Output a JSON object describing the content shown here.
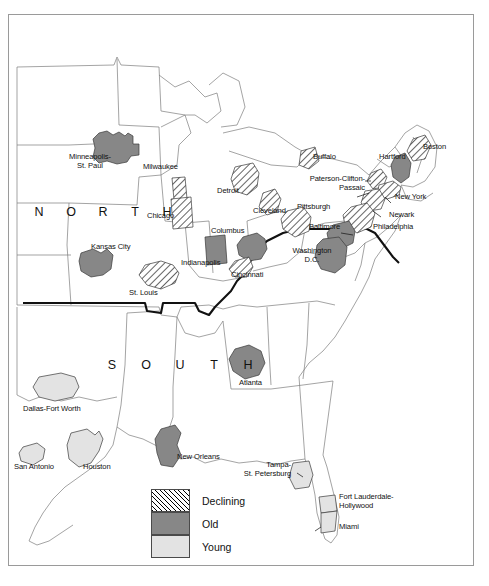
{
  "figure": {
    "regions": [
      {
        "name": "north",
        "letters": [
          "N",
          "O",
          "R",
          "T",
          "H"
        ]
      },
      {
        "name": "south",
        "letters": [
          "S",
          "O",
          "U",
          "T",
          "H"
        ]
      }
    ]
  },
  "legend": {
    "title": "",
    "items": [
      {
        "key": "declining",
        "label": "Declining",
        "pattern": "diagonal-hatch",
        "color": "#ffffff"
      },
      {
        "key": "old",
        "label": "Old",
        "pattern": "solid",
        "color": "#878787"
      },
      {
        "key": "young",
        "label": "Young",
        "pattern": "solid",
        "color": "#e3e3e3"
      }
    ]
  },
  "cities": [
    {
      "id": "minneapolis-st-paul",
      "label": "Minneapolis-\nSt. Paul",
      "category": "old"
    },
    {
      "id": "milwaukee",
      "label": "Milwaukee",
      "category": "declining"
    },
    {
      "id": "chicago",
      "label": "Chicago",
      "category": "declining"
    },
    {
      "id": "detroit",
      "label": "Detroit",
      "category": "declining"
    },
    {
      "id": "cleveland",
      "label": "Cleveland",
      "category": "declining"
    },
    {
      "id": "buffalo",
      "label": "Buffalo",
      "category": "declining"
    },
    {
      "id": "pittsburgh",
      "label": "Pittsburgh",
      "category": "declining"
    },
    {
      "id": "hartford",
      "label": "Hartford",
      "category": "old"
    },
    {
      "id": "boston",
      "label": "Boston",
      "category": "declining"
    },
    {
      "id": "paterson-clifton-passaic",
      "label": "Paterson-Clifton-\nPassaic",
      "category": "declining"
    },
    {
      "id": "new-york",
      "label": "New York",
      "category": "declining"
    },
    {
      "id": "newark",
      "label": "Newark",
      "category": "declining"
    },
    {
      "id": "philadelphia",
      "label": "Philadelphia",
      "category": "declining"
    },
    {
      "id": "baltimore",
      "label": "Baltimore",
      "category": "old"
    },
    {
      "id": "washington-dc",
      "label": "Washington\nD.C.",
      "category": "old"
    },
    {
      "id": "columbus",
      "label": "Columbus",
      "category": "old"
    },
    {
      "id": "indianapolis",
      "label": "Indianapolis",
      "category": "old"
    },
    {
      "id": "cincinnati",
      "label": "Cincinnati",
      "category": "declining"
    },
    {
      "id": "st-louis",
      "label": "St. Louis",
      "category": "declining"
    },
    {
      "id": "kansas-city",
      "label": "Kansas City",
      "category": "old"
    },
    {
      "id": "atlanta",
      "label": "Atlanta",
      "category": "old"
    },
    {
      "id": "dallas-fort-worth",
      "label": "Dallas-Fort Worth",
      "category": "young"
    },
    {
      "id": "san-antonio",
      "label": "San Antonio",
      "category": "young"
    },
    {
      "id": "houston",
      "label": "Houston",
      "category": "young"
    },
    {
      "id": "new-orleans",
      "label": "New Orleans",
      "category": "old"
    },
    {
      "id": "tampa-st-petersburg",
      "label": "Tampa-\nSt. Petersburg",
      "category": "young"
    },
    {
      "id": "fort-lauderdale-hollywood",
      "label": "Fort Lauderdale-\nHollywood",
      "category": "young"
    },
    {
      "id": "miami",
      "label": "Miami",
      "category": "young"
    }
  ],
  "colors": {
    "declining_fill": "#ffffff",
    "old_fill": "#878787",
    "young_fill": "#e3e3e3",
    "state_outline": "#6a6a6a",
    "region_divider": "#000000",
    "frame": "#9a9a9a"
  }
}
